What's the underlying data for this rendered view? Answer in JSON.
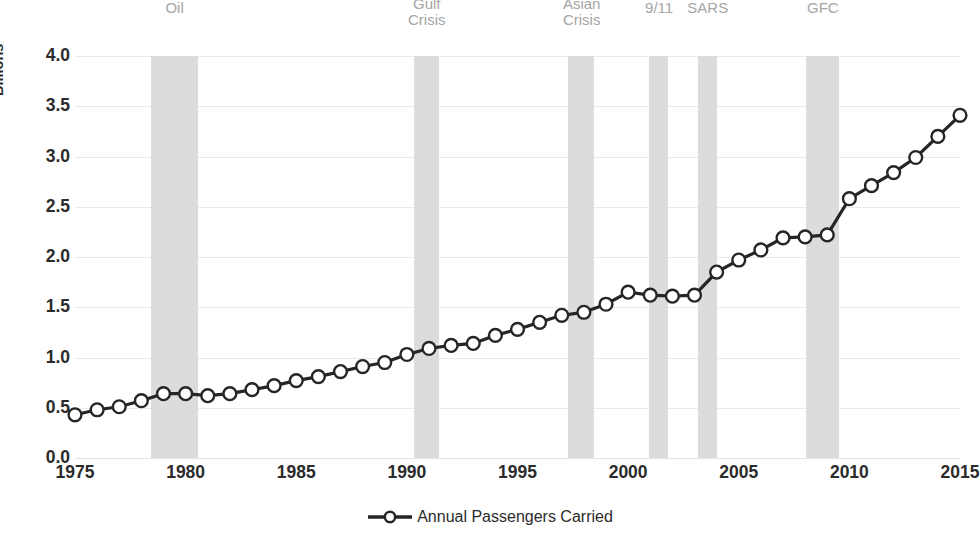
{
  "chart_data": {
    "type": "line",
    "title": "",
    "xlabel": "",
    "ylabel": "Billions",
    "xlim": [
      1975,
      2015
    ],
    "ylim": [
      0.0,
      4.0
    ],
    "grid": true,
    "legend_position": "bottom",
    "series": [
      {
        "name": "Annual Passengers Carried",
        "x": [
          1975,
          1976,
          1977,
          1978,
          1979,
          1980,
          1981,
          1982,
          1983,
          1984,
          1985,
          1986,
          1987,
          1988,
          1989,
          1990,
          1991,
          1992,
          1993,
          1994,
          1995,
          1996,
          1997,
          1998,
          1999,
          2000,
          2001,
          2002,
          2003,
          2004,
          2005,
          2006,
          2007,
          2008,
          2009,
          2010,
          2011,
          2012,
          2013,
          2014,
          2015
        ],
        "values": [
          0.43,
          0.48,
          0.51,
          0.57,
          0.64,
          0.64,
          0.62,
          0.64,
          0.68,
          0.72,
          0.77,
          0.81,
          0.86,
          0.91,
          0.95,
          1.03,
          1.09,
          1.12,
          1.14,
          1.22,
          1.28,
          1.35,
          1.42,
          1.45,
          1.53,
          1.65,
          1.62,
          1.61,
          1.62,
          1.85,
          1.97,
          2.07,
          2.19,
          2.2,
          2.22,
          2.58,
          2.71,
          2.84,
          2.99,
          3.2,
          3.41
        ]
      }
    ],
    "y_ticks": [
      "4.0",
      "3.5",
      "3.0",
      "2.5",
      "2.0",
      "1.5",
      "1.0",
      "0.5",
      "0.0"
    ],
    "y_tick_values": [
      4.0,
      3.5,
      3.0,
      2.5,
      2.0,
      1.5,
      1.0,
      0.5,
      0.0
    ],
    "x_ticks": [
      "1975",
      "1980",
      "1985",
      "1990",
      "1995",
      "2000",
      "2005",
      "2010",
      "2015"
    ],
    "x_tick_values": [
      1975,
      1980,
      1985,
      1990,
      1995,
      2000,
      2005,
      2010,
      2015
    ],
    "event_bands": [
      {
        "label": "Oil",
        "start": 1978.45,
        "end": 1980.55,
        "label_x": 1979.5
      },
      {
        "label": "Gulf\nCrisis",
        "start": 1990.3,
        "end": 1991.45,
        "label_x": 1990.9
      },
      {
        "label": "Asian\nCrisis",
        "start": 1997.3,
        "end": 1998.45,
        "label_x": 1997.9
      },
      {
        "label": "9/11",
        "start": 2000.95,
        "end": 2001.8,
        "label_x": 2001.4
      },
      {
        "label": "SARS",
        "start": 2003.15,
        "end": 2004.0,
        "label_x": 2003.6
      },
      {
        "label": "GFC",
        "start": 2008.05,
        "end": 2009.55,
        "label_x": 2008.8
      }
    ],
    "colors": {
      "line": "#262626",
      "marker_fill": "#ffffff",
      "marker_stroke": "#262626",
      "band": "#dcdcdc",
      "grid": "#e9e9e9",
      "text": "#2b2b2b",
      "event_label": "#a5a5a5"
    }
  },
  "legend": {
    "entries": [
      {
        "label": "Annual Passengers Carried"
      }
    ]
  }
}
